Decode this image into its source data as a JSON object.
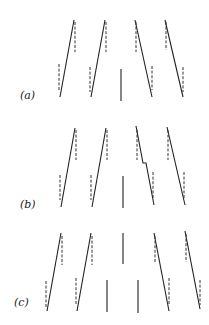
{
  "figure": {
    "panels": [
      {
        "label": "(a)",
        "elements": [
          "rising",
          "rising",
          "vertical",
          "falling",
          "falling"
        ]
      },
      {
        "label": "(b)",
        "elements": [
          "rising",
          "rising",
          "vertical",
          "falling-kinked",
          "falling"
        ]
      },
      {
        "label": "(c)",
        "elements": [
          "rising",
          "rising",
          "vertical-low",
          "vertical-high",
          "vertical-low",
          "falling",
          "falling"
        ]
      }
    ]
  }
}
